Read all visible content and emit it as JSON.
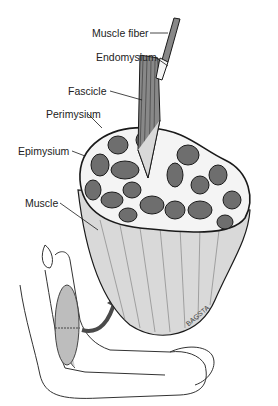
{
  "diagram": {
    "labels": [
      {
        "id": "muscle-fiber",
        "text": "Muscle fiber"
      },
      {
        "id": "endomysium",
        "text": "Endomysium"
      },
      {
        "id": "fascicle",
        "text": "Fascicle"
      },
      {
        "id": "perimysium",
        "text": "Perimysium"
      },
      {
        "id": "epimysium",
        "text": "Epimysium"
      },
      {
        "id": "muscle",
        "text": "Muscle"
      }
    ],
    "signature": "BAGSTA",
    "colors": {
      "line": "#1a1a1a",
      "fascicle_fill": "#6e6e6e",
      "muscle_fill": "#d9d9d9",
      "arrow": "#4a4a4a"
    }
  }
}
